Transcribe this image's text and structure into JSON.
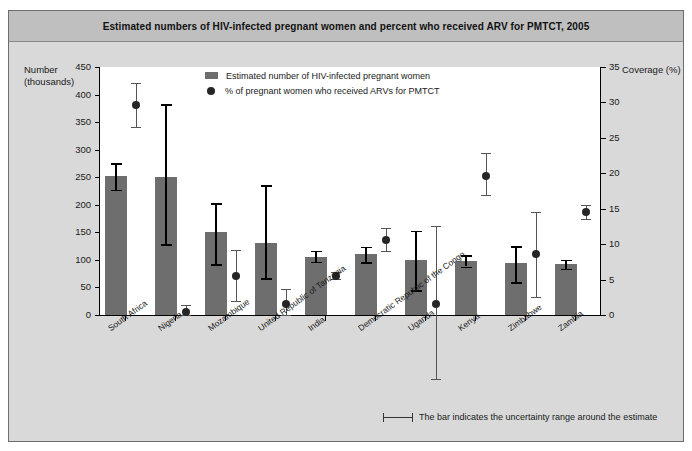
{
  "title": "Estimated numbers of HIV-infected pregnant women and percent who received ARV for PMTCT, 2005",
  "legend": {
    "bars_label": "Estimated number of HIV-infected pregnant women",
    "dots_label": "% of pregnant women who received ARVs for PMTCT"
  },
  "footnote": "The bar indicates the uncertainty range around the estimate",
  "axes": {
    "left_title_line1": "Number",
    "left_title_line2": "(thousands)",
    "right_title": "Coverage (%)",
    "left_ticks": [
      "0",
      "50",
      "100",
      "150",
      "200",
      "250",
      "300",
      "350",
      "400",
      "450"
    ],
    "right_ticks": [
      "0",
      "5",
      "10",
      "15",
      "20",
      "25",
      "30",
      "35"
    ]
  },
  "chart_data": {
    "type": "bar",
    "title": "Estimated numbers of HIV-infected pregnant women and percent who received ARV for PMTCT, 2005",
    "xlabel": "",
    "ylabel": "Number (thousands)",
    "y2label": "Coverage (%)",
    "ylim": [
      0,
      450
    ],
    "y2lim": [
      0,
      35
    ],
    "grid": false,
    "legend_position": "top-center",
    "categories": [
      "South Africa",
      "Nigeria",
      "Mozambique",
      "United Republic of Tanzania",
      "India",
      "Democratic Republic of the Congo",
      "Uganda",
      "Kenya",
      "Zimbabwe",
      "Zambia"
    ],
    "series": [
      {
        "name": "Estimated number of HIV-infected pregnant women",
        "type": "bar",
        "axis": "left",
        "units": "thousands",
        "values": [
          252,
          250,
          150,
          131,
          106,
          110,
          99,
          98,
          95,
          92
        ],
        "error_low": [
          227,
          128,
          92,
          67,
          97,
          96,
          45,
          88,
          60,
          84
        ],
        "error_high": [
          275,
          383,
          203,
          235,
          117,
          124,
          153,
          109,
          125,
          100
        ]
      },
      {
        "name": "% of pregnant women who received ARVs for PMTCT",
        "type": "scatter",
        "axis": "right",
        "units": "percent",
        "values": [
          29.7,
          0.4,
          5.5,
          1.6,
          5.5,
          10.6,
          1.6,
          19.6,
          8.6,
          14.5
        ],
        "error_low": [
          26.5,
          0.0,
          2.0,
          0.0,
          5.1,
          9.0,
          -9.0,
          17.0,
          2.5,
          13.5
        ],
        "error_high": [
          32.8,
          1.4,
          9.2,
          3.7,
          6.0,
          12.3,
          12.5,
          22.8,
          14.5,
          15.5
        ]
      }
    ]
  },
  "colors": {
    "bar": "#6e6e6e",
    "dot": "#262626",
    "panel": "#d9d9d9",
    "title_band": "#bfbfbf",
    "plot": "#ffffff"
  }
}
